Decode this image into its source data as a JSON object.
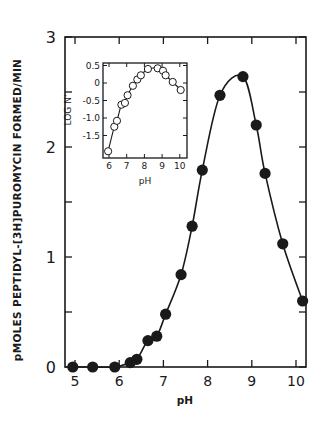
{
  "chart_data": [
    {
      "type": "line",
      "title": "",
      "xlabel": "pH",
      "ylabel": "pMOLES PEPTIDYL-[3H]PUROMYCIN FORMED/MIN",
      "xlim": [
        4.9,
        10.25
      ],
      "ylim": [
        0,
        3
      ],
      "xticks": [
        5,
        6,
        7,
        8,
        9,
        10
      ],
      "yticks": [
        0,
        1,
        2,
        3
      ],
      "grid": false,
      "marker": "filled-circle",
      "series": [
        {
          "name": "activity",
          "x": [
            4.95,
            5.4,
            5.9,
            6.25,
            6.4,
            6.65,
            6.85,
            7.05,
            7.4,
            7.65,
            7.88,
            8.28,
            8.8,
            9.1,
            9.3,
            9.7,
            10.15
          ],
          "y": [
            0.0,
            0.0,
            0.0,
            0.04,
            0.07,
            0.24,
            0.28,
            0.48,
            0.84,
            1.28,
            1.79,
            2.47,
            2.64,
            2.2,
            1.76,
            1.12,
            0.6
          ]
        }
      ]
    },
    {
      "type": "line",
      "title": "inset",
      "xlabel": "pH",
      "ylabel": "LOG N'",
      "xlim": [
        5.8,
        10.3
      ],
      "ylim": [
        -2.15,
        0.6
      ],
      "xticks": [
        6,
        7,
        8,
        9,
        10
      ],
      "yticks": [
        0.5,
        0,
        -0.5,
        -1.0,
        -1.5
      ],
      "ytick_labels": [
        "0.5",
        "0",
        "-0.5",
        "-1.0",
        "-1.5"
      ],
      "grid": false,
      "marker": "open-circle",
      "series": [
        {
          "name": "log N'",
          "x": [
            5.95,
            6.3,
            6.45,
            6.7,
            6.9,
            7.05,
            7.35,
            7.6,
            7.8,
            8.2,
            8.75,
            9.05,
            9.2,
            9.6,
            10.05
          ],
          "y": [
            -1.95,
            -1.25,
            -1.08,
            -0.62,
            -0.57,
            -0.35,
            -0.08,
            0.1,
            0.22,
            0.4,
            0.42,
            0.35,
            0.22,
            0.03,
            -0.2
          ]
        }
      ]
    }
  ],
  "labels": {
    "main_xlabel": "pH",
    "main_ylabel": "pMOLES PEPTIDYL-[3H]PUROMYCIN FORMED/MIN",
    "inset_xlabel": "pH",
    "inset_ylabel": "LOG N'"
  },
  "colors": {
    "ink": "#1a1a1a",
    "background": "#ffffff"
  }
}
